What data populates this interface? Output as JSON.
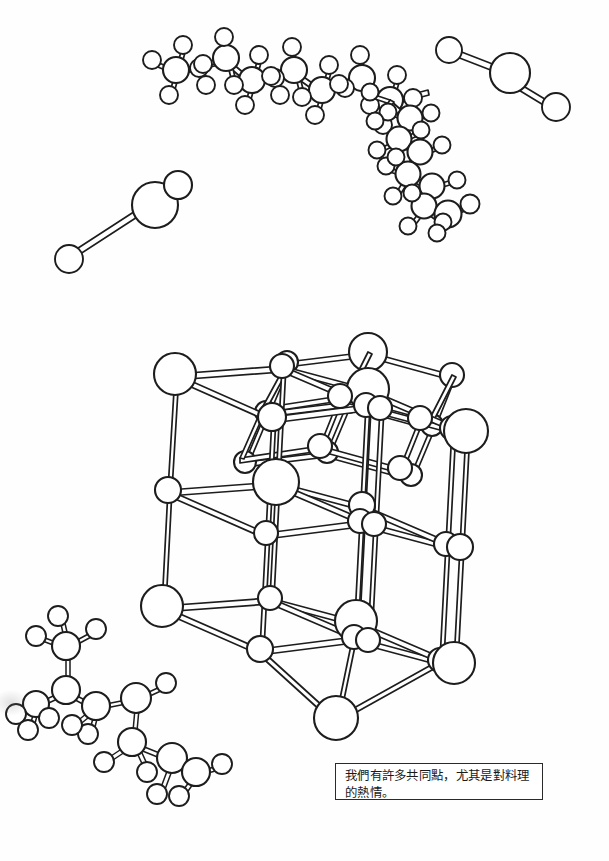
{
  "page": {
    "width": 609,
    "height": 861,
    "background_color": "#ffffff",
    "ink_color": "#1d1d1d"
  },
  "caption": {
    "text": "我們有許多共同點，尤其是對料理的熱情。",
    "line_1": "我們有許多共同點，尤其是對料",
    "line_2": "理的熱情。",
    "border_color": "#2a2a2a",
    "background_color": "#ffffff"
  },
  "figures": [
    {
      "id": "hydrocarbon-chain",
      "label": "long zig-zag hydrocarbon chain molecule",
      "position": "top-left",
      "atom_count": 36
    },
    {
      "id": "branched-chain",
      "label": "branched organic molecule chain descending to the right",
      "position": "top-center-right",
      "atom_count": 30
    },
    {
      "id": "water-molecule-top-right",
      "label": "bent triatomic water molecule model",
      "position": "top-right",
      "atom_count": 3
    },
    {
      "id": "water-molecule-left",
      "label": "bent triatomic water molecule model",
      "position": "upper-left",
      "atom_count": 3
    },
    {
      "id": "crystal-lattice",
      "label": "cubic ionic crystal lattice, 3 by 3 by 3, alternating large and small spheres",
      "position": "center",
      "rows": 3,
      "columns": 3,
      "layers": 3
    },
    {
      "id": "amino-acid-molecule",
      "label": "branched organic molecule ball-and-stick model",
      "position": "bottom-left",
      "atom_count": 24
    }
  ],
  "legend": {
    "large_sphere": "large ion / heavy atom",
    "small_sphere": "small ion / hydrogen atom",
    "rod": "chemical bond"
  }
}
